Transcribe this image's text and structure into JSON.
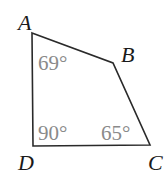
{
  "diagram": {
    "type": "quadrilateral",
    "vertices": [
      {
        "name": "A",
        "x": 32,
        "y": 33,
        "label_x": 18,
        "label_y": 30
      },
      {
        "name": "B",
        "x": 113,
        "y": 63,
        "label_x": 121,
        "label_y": 62
      },
      {
        "name": "C",
        "x": 150,
        "y": 145,
        "label_x": 148,
        "label_y": 170
      },
      {
        "name": "D",
        "x": 33,
        "y": 146,
        "label_x": 18,
        "label_y": 170
      }
    ],
    "angles": [
      {
        "vertex": "A",
        "label": "69°",
        "x": 38,
        "y": 70
      },
      {
        "vertex": "D",
        "label": "90°",
        "x": 38,
        "y": 140
      },
      {
        "vertex": "C",
        "label": "65°",
        "x": 101,
        "y": 140
      }
    ],
    "colors": {
      "edge": "#2a2a2a",
      "vertex_label": "#1a1a1a",
      "angle_label": "#8a8a8a",
      "background": "#ffffff"
    }
  },
  "labels": {
    "A": "A",
    "B": "B",
    "C": "C",
    "D": "D",
    "angle_A": "69°",
    "angle_D": "90°",
    "angle_C": "65°"
  }
}
